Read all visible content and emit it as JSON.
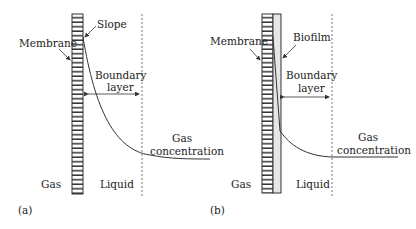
{
  "panels": [
    {
      "id": "a",
      "tag": "(a)",
      "labels": {
        "membrane": "Membrane",
        "slope": "Slope",
        "boundary_line1": "Boundary",
        "boundary_line2": "layer",
        "gas_conc_line1": "Gas",
        "gas_conc_line2": "concentration",
        "gas": "Gas",
        "liquid": "Liquid"
      }
    },
    {
      "id": "b",
      "tag": "(b)",
      "labels": {
        "membrane": "Membrane",
        "biofilm": "Biofilm",
        "boundary_line1": "Boundary",
        "boundary_line2": "layer",
        "gas_conc_line1": "Gas",
        "gas_conc_line2": "concentration",
        "gas": "Gas",
        "liquid": "Liquid"
      }
    }
  ],
  "colors": {
    "line": "#333333",
    "biofilm_fill": "#e6e6e6"
  }
}
